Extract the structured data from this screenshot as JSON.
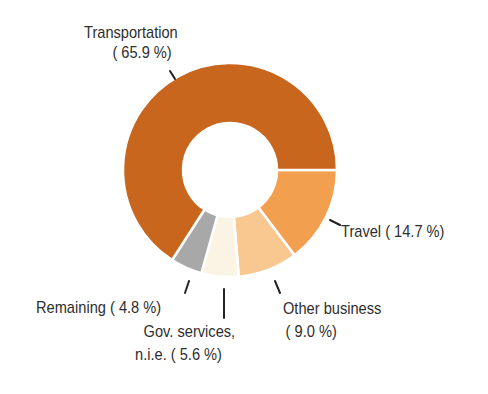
{
  "chart_data": {
    "type": "pie",
    "variant": "donut",
    "title": "",
    "start_angle_deg": 0,
    "direction": "clockwise",
    "center": [
      230,
      170
    ],
    "outer_radius": 107,
    "inner_radius": 47,
    "slices": [
      {
        "label": "Travel",
        "value": 14.7,
        "color": "#F2A050",
        "display": "Travel ( 14.7 %)"
      },
      {
        "label": "Other business",
        "value": 9.0,
        "color": "#F8C890",
        "display_line1": "Other business",
        "display_line2": "(  9.0 %)"
      },
      {
        "label": "Gov. services, n.i.e.",
        "value": 5.6,
        "color": "#FBF4E4",
        "display_line1": "Gov. services,",
        "display_line2": "n.i.e. (  5.6 %)"
      },
      {
        "label": "Remaining",
        "value": 4.8,
        "color": "#A8A8A8",
        "display": "Remaining (  4.8 %)"
      },
      {
        "label": "Transportation",
        "value": 65.9,
        "color": "#C8661E",
        "display_line1": "Transportation",
        "display_line2": "( 65.9 %)"
      }
    ],
    "separator_color": "#FFFFFF",
    "leader_line_color": "#222222",
    "label_color": "#2E2E2E",
    "legend": "none"
  }
}
